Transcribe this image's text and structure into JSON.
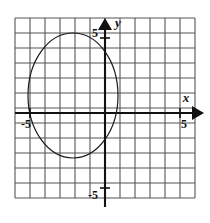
{
  "figure": {
    "type": "coordinate-grid-plot",
    "background_color": "#ffffff",
    "grid": {
      "line_color": "#555555",
      "columns": 12,
      "rows": 12,
      "cell_px": 15,
      "left_px": 15,
      "top_px": 18,
      "x_min": -6,
      "x_max": 6,
      "y_min": -6,
      "y_max": 6
    },
    "axes": {
      "color": "#111111",
      "origin_px": {
        "x": 105,
        "y": 113
      },
      "x_axis": {
        "label": "x",
        "label_pos_px": {
          "x": 190,
          "y": 100
        },
        "arrow": "right-arrow-icon",
        "tick_label": "5",
        "tick_label_pos_px": {
          "x": 181,
          "y": 124
        }
      },
      "y_axis": {
        "label": "y",
        "label_pos_px": {
          "x": 118,
          "y": 22
        },
        "arrow": "up-arrow-icon",
        "tick_label_top": "5",
        "tick_label_top_pos_px": {
          "x": 92,
          "y": 32
        },
        "tick_label_bottom": "-5",
        "tick_label_bottom_pos_px": {
          "x": 89,
          "y": 196
        }
      },
      "x_axis_negative_tick_label": "-5",
      "x_axis_negative_tick_label_pos_px": {
        "x": 22,
        "y": 124
      }
    }
  },
  "chart_data": {
    "type": "scatter",
    "title": "",
    "xlabel": "x",
    "ylabel": "y",
    "xlim": [
      -6,
      6
    ],
    "ylim": [
      -6,
      6
    ],
    "grid": true,
    "legend": "none",
    "xticks": [
      -5,
      5
    ],
    "yticks": [
      -5,
      5
    ],
    "xtick_labels": [
      "-5",
      "5"
    ],
    "ytick_labels": [
      "-5",
      "5"
    ],
    "series": [
      {
        "name": "circle",
        "shape": "ellipse",
        "stroke_color": "#1a1a1a",
        "stroke_width_px": 1.2,
        "fill": "none",
        "center": {
          "x": -2.1,
          "y": 1.2
        },
        "radius_x": 3.0,
        "radius_y": 4.2,
        "center_px": {
          "x": 73,
          "y": 95.5
        },
        "radius_x_px": 45,
        "radius_y_px": 62.5
      }
    ],
    "annotations": [
      {
        "text": "x",
        "x_px": 190,
        "y_px": 100
      },
      {
        "text": "y",
        "x_px": 118,
        "y_px": 22
      },
      {
        "text": "5",
        "x_px": 92,
        "y_px": 32
      },
      {
        "text": "5",
        "x_px": 181,
        "y_px": 124
      },
      {
        "text": "-5",
        "x_px": 22,
        "y_px": 124
      },
      {
        "text": "-5",
        "x_px": 89,
        "y_px": 196
      }
    ]
  }
}
